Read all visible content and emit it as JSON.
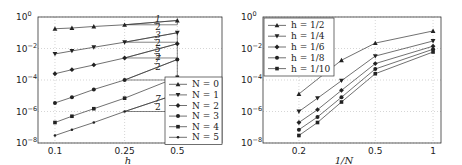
{
  "chart_data": [
    {
      "type": "line",
      "scale": "loglog",
      "title": "",
      "xlabel": "h",
      "ylabel": "",
      "xlim": [
        0.08,
        0.9
      ],
      "ylim": [
        1e-08,
        1
      ],
      "xticks": [
        "0.1",
        "0.25",
        "0.5"
      ],
      "yticks": [
        "10^0",
        "10^-2",
        "10^-4",
        "10^-6",
        "10^-8"
      ],
      "grid": true,
      "legend_position": "lower right",
      "x": [
        0.1,
        0.125,
        0.1667,
        0.25,
        0.5
      ],
      "series": [
        {
          "name": "N = 0",
          "marker": "triangle-up",
          "values": [
            0.18,
            0.2,
            0.25,
            0.32,
            0.6
          ]
        },
        {
          "name": "N = 1",
          "marker": "triangle-down",
          "values": [
            0.0045,
            0.007,
            0.012,
            0.025,
            0.1
          ]
        },
        {
          "name": "N = 2",
          "marker": "diamond",
          "values": [
            0.00025,
            0.00045,
            0.0009,
            0.0025,
            0.02
          ]
        },
        {
          "name": "N = 3",
          "marker": "circle",
          "values": [
            3.5e-06,
            8e-06,
            2.5e-05,
            0.0001,
            0.002
          ]
        },
        {
          "name": "N = 4",
          "marker": "square",
          "values": [
            2e-07,
            5e-07,
            1.5e-06,
            7e-06,
            0.00015
          ]
        },
        {
          "name": "N = 5",
          "marker": "star",
          "values": [
            3e-08,
            7e-08,
            2e-07,
            1e-06,
            1.3e-05
          ]
        }
      ],
      "annotations": [
        {
          "text": "1/2",
          "at": "N=0 slope triangle"
        },
        {
          "text": "3/2",
          "at": "N=1 slope triangle"
        },
        {
          "text": "5/2",
          "at": "N=2 slope triangle"
        },
        {
          "text": "7/2",
          "at": "N=3 slope triangle"
        },
        {
          "text": "7/2",
          "at": "N=5 slope triangle"
        }
      ]
    },
    {
      "type": "line",
      "scale": "loglog",
      "title": "",
      "xlabel": "1/N",
      "ylabel": "",
      "xlim": [
        0.13,
        1.1
      ],
      "ylim": [
        1e-08,
        1
      ],
      "xticks": [
        "0.2",
        "0.5",
        "1"
      ],
      "yticks": [
        "10^0",
        "10^-2",
        "10^-4",
        "10^-6",
        "10^-8"
      ],
      "grid": true,
      "legend_position": "upper left",
      "x": [
        0.2,
        0.25,
        0.3333,
        0.5,
        1
      ],
      "series": [
        {
          "name": "h = 1/2",
          "marker": "triangle-up",
          "values": [
            1.3e-05,
            null,
            0.0018,
            0.022,
            0.13
          ]
        },
        {
          "name": "h = 1/4",
          "marker": "triangle-down",
          "values": [
            1e-06,
            7e-06,
            9e-05,
            0.0033,
            0.03
          ]
        },
        {
          "name": "h = 1/6",
          "marker": "diamond",
          "values": [
            2e-07,
            1.3e-06,
            2.2e-05,
            0.0011,
            0.014
          ]
        },
        {
          "name": "h = 1/8",
          "marker": "circle",
          "values": [
            7e-08,
            4.5e-07,
            8e-06,
            0.0005,
            0.009
          ]
        },
        {
          "name": "h = 1/10",
          "marker": "square",
          "values": [
            3e-08,
            2e-07,
            4e-06,
            0.00025,
            0.006
          ]
        }
      ]
    }
  ],
  "left": {
    "xlabel": "h",
    "xticks": [
      "0.1",
      "0.25",
      "0.5"
    ],
    "ytick_base": "10",
    "ytick_exps": [
      "0",
      "−2",
      "−4",
      "−6",
      "−8"
    ],
    "legend": [
      "N = 0",
      "N = 1",
      "N = 2",
      "N = 3",
      "N = 4",
      "N = 5"
    ],
    "slopes": [
      "1",
      "2",
      "3",
      "2",
      "5",
      "2",
      "7",
      "2",
      "7",
      "2"
    ]
  },
  "right": {
    "xlabel": "1/N",
    "xticks": [
      "0.2",
      "0.5",
      "1"
    ],
    "ytick_base": "10",
    "ytick_exps": [
      "0",
      "−2",
      "−4",
      "−6",
      "−8"
    ],
    "legend": [
      "h = 1/2",
      "h = 1/4",
      "h = 1/6",
      "h = 1/8",
      "h = 1/10"
    ]
  }
}
